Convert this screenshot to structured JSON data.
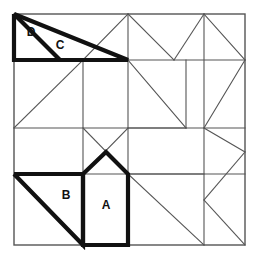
{
  "figure": {
    "background_color": "#ffffff",
    "thin_line_color": "#555555",
    "bold_line_color": "#111111",
    "canvas": {
      "width": 259,
      "height": 257
    },
    "square": {
      "left": 14,
      "top": 14,
      "right": 245,
      "bottom": 245
    },
    "labels": [
      {
        "id": "label-a",
        "text": "A",
        "x": 106,
        "y": 206
      },
      {
        "id": "label-b",
        "text": "B",
        "x": 66,
        "y": 196
      },
      {
        "id": "label-c",
        "text": "C",
        "x": 60,
        "y": 46
      },
      {
        "id": "label-d",
        "text": "D",
        "x": 31,
        "y": 33
      }
    ],
    "thin_segments": [
      {
        "name": "grid-h-60",
        "points": "14,60 245,60"
      },
      {
        "name": "grid-h-128",
        "points": "14,128 245,128"
      },
      {
        "name": "grid-h-174",
        "points": "14,174 245,174"
      },
      {
        "name": "grid-v-83",
        "points": "83,60 83,245"
      },
      {
        "name": "grid-v-128",
        "points": "128,14 128,245"
      },
      {
        "name": "grid-v-204",
        "points": "204,14 204,245"
      },
      {
        "name": "tl-square-diagonal",
        "points": "14,128 83,60"
      },
      {
        "name": "mid-square-diagonal",
        "points": "128,60 186,128"
      },
      {
        "name": "center-x-left",
        "points": "83,128 128,174"
      },
      {
        "name": "center-x-right",
        "points": "128,128 83,174"
      },
      {
        "name": "upper-mid-diag-left",
        "points": "83,60 128,14"
      },
      {
        "name": "upper-mid-diag-right",
        "points": "128,14 174,60"
      },
      {
        "name": "right-zigzag-a",
        "points": "204,14 245,60"
      },
      {
        "name": "right-zigzag-b",
        "points": "174,60 204,14"
      },
      {
        "name": "right-zigzag-c",
        "points": "204,128 245,60"
      },
      {
        "name": "right-zigzag-d",
        "points": "204,128 245,152"
      },
      {
        "name": "right-zigzag-e",
        "points": "245,152 204,200"
      },
      {
        "name": "right-zigzag-f",
        "points": "204,200 245,245"
      },
      {
        "name": "right-zigzag-g",
        "points": "204,200 204,245"
      },
      {
        "name": "mid-right-lower-diag",
        "points": "128,174 204,245"
      },
      {
        "name": "inner-box-h-128-186",
        "points": "128,128 186,128"
      },
      {
        "name": "inner-right-h-174",
        "points": "128,174 204,174"
      }
    ],
    "bold_pieces": [
      {
        "name": "piece-c-d-outline",
        "description": "Large right triangle at top-left split into D and C",
        "points": "14,14 128,60 14,60 14,14"
      },
      {
        "name": "piece-d-divider",
        "description": "Diagonal separating D from C",
        "points": "14,14 60,60"
      },
      {
        "name": "piece-b-outline",
        "description": "Right triangle B at lower-left",
        "points": "14,174 83,174 83,245 14,174"
      },
      {
        "name": "piece-a-outline",
        "description": "House-shaped pentagon A at lower-middle",
        "points": "83,174 106,152 128,174 128,245 83,245 83,174"
      }
    ]
  }
}
